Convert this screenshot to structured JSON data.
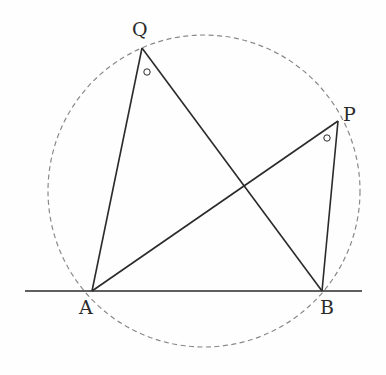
{
  "diagram": {
    "type": "geometry-inscribed-angles",
    "colors": {
      "line": "#2a2a2a",
      "circle": "#8a8a8a",
      "background": "#fefefe"
    },
    "circle": {
      "cx": 204,
      "cy": 191,
      "r": 156,
      "style": "dashed"
    },
    "baseline": {
      "x1": 25,
      "y1": 291,
      "x2": 362,
      "y2": 291
    },
    "points": {
      "A": {
        "x": 92,
        "y": 291,
        "label": "A",
        "lx": 79,
        "ly": 314
      },
      "B": {
        "x": 322,
        "y": 291,
        "label": "B",
        "lx": 320,
        "ly": 314
      },
      "P": {
        "x": 338,
        "y": 121,
        "label": "P",
        "lx": 343,
        "ly": 121
      },
      "Q": {
        "x": 142,
        "y": 48,
        "label": "Q",
        "lx": 132,
        "ly": 36
      }
    },
    "segments": [
      {
        "from": "A",
        "to": "Q"
      },
      {
        "from": "Q",
        "to": "B"
      },
      {
        "from": "A",
        "to": "P"
      },
      {
        "from": "P",
        "to": "B"
      }
    ],
    "angle_marks": [
      {
        "at": "Q",
        "cx": 147,
        "cy": 72,
        "r": 3.2,
        "symbol": "○"
      },
      {
        "at": "P",
        "cx": 327,
        "cy": 138,
        "r": 3.2,
        "symbol": "○"
      }
    ]
  }
}
